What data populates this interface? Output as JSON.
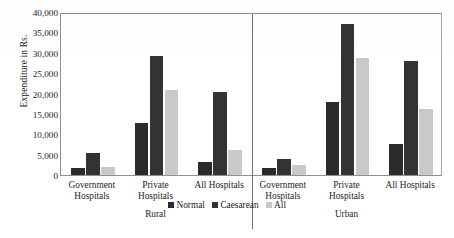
{
  "chart_data": {
    "type": "bar",
    "title": "",
    "xlabel": "",
    "ylabel": "Expenditure in Rs.",
    "ylim": [
      0,
      40000
    ],
    "ytick_labels": [
      "40,000",
      "35,000",
      "30,000",
      "25,000",
      "20,000",
      "15,000",
      "10,000",
      "5,000",
      "0"
    ],
    "ytick_values": [
      40000,
      35000,
      30000,
      25000,
      20000,
      15000,
      10000,
      5000,
      0
    ],
    "grid": false,
    "legend_position": "bottom-center",
    "sections": [
      "Rural",
      "Urban"
    ],
    "categories": [
      "Government Hospitals",
      "Private Hospitals",
      "All Hospitals",
      "Government Hospitals",
      "Private Hospitals",
      "All Hospitals"
    ],
    "category_lines": [
      [
        "Government",
        "Hospitals"
      ],
      [
        "Private",
        "Hospitals"
      ],
      [
        "All Hospitals",
        ""
      ],
      [
        "Government",
        "Hospitals"
      ],
      [
        "Private",
        "Hospitals"
      ],
      [
        "All Hospitals",
        ""
      ]
    ],
    "series": [
      {
        "name": "Normal",
        "color": "#2b2b2b",
        "values": [
          1800,
          12700,
          3200,
          1800,
          18000,
          7600
        ]
      },
      {
        "name": "Caesarean",
        "color": "#333333",
        "values": [
          5300,
          29300,
          20300,
          4000,
          37000,
          28000
        ]
      },
      {
        "name": "All",
        "color": "#c9c9c9",
        "values": [
          2000,
          20800,
          6200,
          2400,
          28700,
          16300
        ]
      }
    ]
  },
  "axis": {
    "y_title": "Expenditure in Rs."
  },
  "legend": {
    "items": [
      {
        "label": "Normal"
      },
      {
        "label": "Caesarean"
      },
      {
        "label": "All"
      }
    ]
  },
  "sections": [
    {
      "label": "Rural"
    },
    {
      "label": "Urban"
    }
  ]
}
